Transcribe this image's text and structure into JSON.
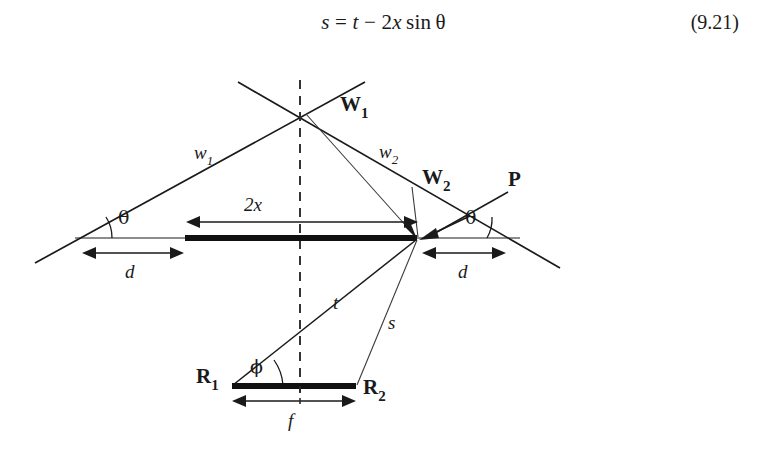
{
  "equation": {
    "lhs": "s",
    "relation": "=",
    "rhs": "t − 2x sinθ",
    "full_text": "s = t − 2x sinθ",
    "number": "(9.21)"
  },
  "figure": {
    "colors": {
      "line": "#1a1a1a",
      "thick_bar": "#111111",
      "dashed": "#2a2a2a",
      "background": "#ffffff"
    },
    "labels": {
      "w1_lower": "w",
      "w1_lower_sub": "1",
      "w2_lower": "w",
      "w2_lower_sub": "2",
      "W1_bold": "W",
      "W1_bold_sub": "1",
      "W2_bold": "W",
      "W2_bold_sub": "2",
      "P_bold": "P",
      "theta_left": "θ",
      "theta_right": "θ",
      "d_left": "d",
      "d_right": "d",
      "two_x": "2x",
      "t": "t",
      "s": "s",
      "phi": "ϕ",
      "R1": "R",
      "R1_sub": "1",
      "R2": "R",
      "R2_sub": "2",
      "f": "f"
    },
    "segments": {
      "aperture_2x": "2x",
      "baseline_f": "f",
      "offset_d": "d",
      "range_t": "t",
      "range_s": "s"
    },
    "angles": {
      "incidence_theta": "θ",
      "bistatic_phi": "ϕ"
    }
  }
}
